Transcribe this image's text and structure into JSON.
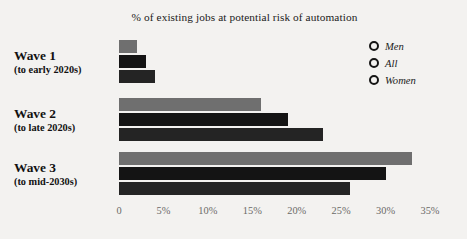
{
  "chart_data": {
    "type": "bar",
    "orientation": "horizontal",
    "title": "% of existing jobs at potential risk of automation",
    "xlabel": "",
    "ylabel": "",
    "xlim": [
      0,
      35
    ],
    "grid": false,
    "legend_position": "top-right",
    "categories": [
      "Wave 1",
      "Wave 2",
      "Wave 3"
    ],
    "category_sublabels": [
      "(to early 2020s)",
      "(to late 2020s)",
      "(to mid-2030s)"
    ],
    "xticks": [
      0,
      5,
      10,
      15,
      20,
      25,
      30,
      35
    ],
    "xtick_labels": [
      "0",
      "5%",
      "10%",
      "15%",
      "20%",
      "25%",
      "30%",
      "35%"
    ],
    "series": [
      {
        "name": "Men",
        "color": "#6f6f6f",
        "values": [
          2,
          16,
          33
        ]
      },
      {
        "name": "All",
        "color": "#141414",
        "values": [
          3,
          19,
          30
        ]
      },
      {
        "name": "Women",
        "color": "#242424",
        "values": [
          4,
          23,
          26
        ]
      }
    ]
  },
  "legend": {
    "items": [
      {
        "label": "Men"
      },
      {
        "label": "All"
      },
      {
        "label": "Women"
      }
    ]
  },
  "colors": {
    "background": "#f3f2f0",
    "men": "#6f6f6f",
    "all": "#141414",
    "women": "#242424",
    "text": "#1b1b1b",
    "axis_text": "#6c6a68"
  }
}
